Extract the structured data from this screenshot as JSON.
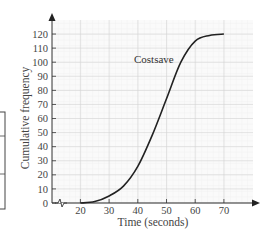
{
  "chart_data": {
    "type": "line",
    "title": "",
    "xlabel": "Time (seconds)",
    "ylabel": "Cumulative frequency",
    "xlim": [
      10,
      78
    ],
    "ylim": [
      0,
      125
    ],
    "x_ticks": [
      20,
      30,
      40,
      50,
      60,
      70
    ],
    "y_ticks": [
      0,
      10,
      20,
      30,
      40,
      50,
      60,
      70,
      80,
      90,
      100,
      110,
      120
    ],
    "grid": true,
    "x_axis_break": true,
    "series": [
      {
        "name": "Costsave",
        "x": [
          20,
          25,
          30,
          35,
          40,
          45,
          50,
          55,
          60,
          65,
          70
        ],
        "values": [
          0,
          1,
          5,
          12,
          26,
          48,
          74,
          100,
          115,
          119,
          120
        ]
      }
    ],
    "annotations": [
      {
        "text": "Costsave",
        "x": 40,
        "y": 100
      }
    ]
  }
}
